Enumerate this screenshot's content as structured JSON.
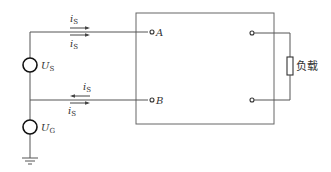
{
  "diagram": {
    "type": "circuit",
    "terminals": {
      "A": "A",
      "B": "B"
    },
    "sources": {
      "us": {
        "symbol": "U",
        "subscript": "S"
      },
      "ug": {
        "symbol": "U",
        "subscript": "G"
      }
    },
    "currents": {
      "top_upper": {
        "symbol": "i",
        "subscript": "S",
        "direction": "right"
      },
      "top_lower": {
        "symbol": "i",
        "subscript": "S",
        "direction": "right"
      },
      "bottom_upper": {
        "symbol": "i",
        "subscript": "S",
        "direction": "left"
      },
      "bottom_lower": {
        "symbol": "i",
        "subscript": "S",
        "direction": "right"
      }
    },
    "load": {
      "label": "负载"
    },
    "ground": "ground",
    "colors": {
      "wire": "#555555",
      "source": "#111111",
      "text": "#333333"
    }
  }
}
